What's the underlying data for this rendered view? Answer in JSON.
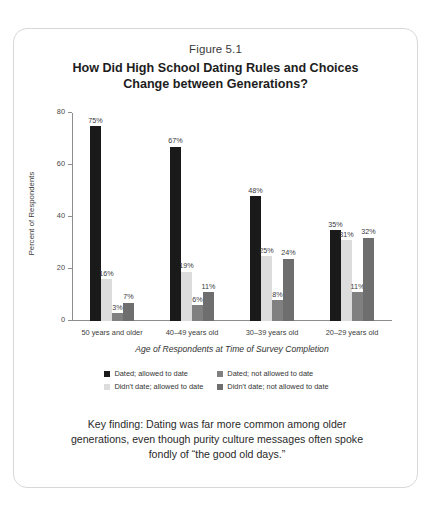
{
  "figure": {
    "caption": "Figure 5.1",
    "title_line1": "How Did High School Dating Rules and Choices",
    "title_line2": "Change between Generations?"
  },
  "key_finding": "Key finding: Dating was far more common among older generations, even though purity culture messages often spoke fondly of “the good old days.”",
  "chart_data": {
    "type": "bar",
    "title": "How Did High School Dating Rules and Choices Change between Generations?",
    "xlabel": "Age of Respondents at Time of Survey Completion",
    "ylabel": "Percent of Respondents",
    "ylim": [
      0,
      80
    ],
    "yticks": [
      0,
      20,
      40,
      60,
      80
    ],
    "grid": false,
    "legend_position": "bottom",
    "value_suffix": "%",
    "categories": [
      "50 years and older",
      "40–49 years old",
      "30–39 years old",
      "20–29 years old"
    ],
    "series": [
      {
        "name": "Dated; allowed to date",
        "color": "#1a1a1a",
        "values": [
          75,
          67,
          48,
          35
        ],
        "labels": [
          "75%",
          "67%",
          "48%",
          "35%"
        ]
      },
      {
        "name": "Didn't date; allowed to date",
        "color": "#dcdcdc",
        "values": [
          16,
          19,
          25,
          31
        ],
        "labels": [
          "16%",
          "19%",
          "25%",
          "31%"
        ]
      },
      {
        "name": "Dated; not allowed to date",
        "color": "#808080",
        "values": [
          3,
          6,
          8,
          11
        ],
        "labels": [
          "3%",
          "6%",
          "8%",
          "11%"
        ]
      },
      {
        "name": "Didn't date; not allowed to date",
        "color": "#6e6e6e",
        "values": [
          7,
          11,
          24,
          32
        ],
        "labels": [
          "7%",
          "11%",
          "24%",
          "32%"
        ]
      }
    ],
    "legend_order": [
      "Dated; allowed to date",
      "Dated; not allowed to date",
      "Didn't date; allowed to date",
      "Didn't date; not allowed to date"
    ]
  }
}
